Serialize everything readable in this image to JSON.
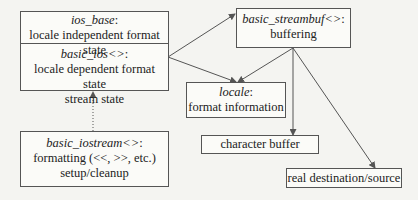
{
  "diagram": {
    "nodes": {
      "ios_base": {
        "class": "ios_base",
        "suffix": ":",
        "lines": [
          "locale independent format state"
        ]
      },
      "basic_ios": {
        "class": "basic_ios<>",
        "suffix": ":",
        "lines": [
          "locale dependent format state",
          "stream state"
        ]
      },
      "basic_iostream": {
        "class": "basic_iostream<>",
        "suffix": ":",
        "lines": [
          "formatting (<<, >>, etc.)",
          "setup/cleanup"
        ]
      },
      "basic_streambuf": {
        "class": "basic_streambuf<>",
        "suffix": ":",
        "lines": [
          "buffering"
        ]
      },
      "locale": {
        "class": "locale",
        "suffix": ":",
        "lines": [
          "format information"
        ]
      },
      "character_buffer": {
        "lines": [
          "character buffer"
        ]
      },
      "real_destination": {
        "lines": [
          "real destination/source"
        ]
      }
    },
    "edges": [
      {
        "from": "basic_ios",
        "to": "basic_streambuf",
        "style": "solid-arrow"
      },
      {
        "from": "basic_ios",
        "to": "locale",
        "style": "solid-arrow"
      },
      {
        "from": "basic_streambuf",
        "to": "locale",
        "style": "solid-arrow"
      },
      {
        "from": "basic_streambuf",
        "to": "character_buffer",
        "style": "solid-arrow"
      },
      {
        "from": "basic_streambuf",
        "to": "real_destination",
        "style": "solid-arrow"
      },
      {
        "from": "basic_iostream",
        "to": "basic_ios",
        "style": "dotted-inheritance"
      }
    ],
    "colors": {
      "line": "#555555",
      "background": "#f4f4f1",
      "box": "#fbfbf8"
    }
  }
}
